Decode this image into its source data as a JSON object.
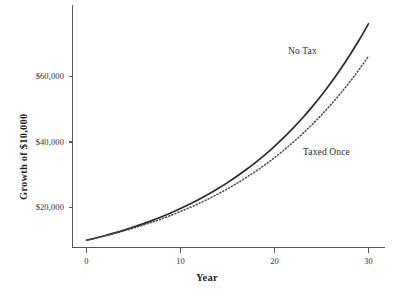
{
  "chart_data": {
    "type": "line",
    "title": "",
    "xlabel": "Year",
    "ylabel": "Growth of $10,000",
    "x": [
      0,
      1,
      2,
      3,
      4,
      5,
      6,
      7,
      8,
      9,
      10,
      11,
      12,
      13,
      14,
      15,
      16,
      17,
      18,
      19,
      20,
      21,
      22,
      23,
      24,
      25,
      26,
      27,
      28,
      29,
      30
    ],
    "xlim": [
      -1.5,
      33
    ],
    "ylim": [
      6500,
      80000
    ],
    "grid": false,
    "legend_position": "inline-annotation",
    "x_tick_values": [
      0,
      10,
      20,
      30
    ],
    "x_tick_labels": [
      "0",
      "10",
      "20",
      "30"
    ],
    "y_tick_values": [
      20000,
      40000,
      60000
    ],
    "y_tick_labels": [
      "$20,000",
      "$40,000",
      "$60,000"
    ],
    "series": [
      {
        "name": "No Tax",
        "style": "solid",
        "annotation": "No Tax",
        "values": [
          10000,
          10700,
          11449,
          12250,
          13108,
          14026,
          15007,
          16058,
          17182,
          18385,
          19672,
          21049,
          22522,
          24098,
          25785,
          27590,
          29522,
          31588,
          33799,
          36165,
          38697,
          41406,
          44304,
          47405,
          50724,
          54274,
          58074,
          62139,
          66488,
          71143,
          76123
        ]
      },
      {
        "name": "Taxed Once",
        "style": "dotted",
        "annotation": "Taxed Once",
        "values": [
          10000,
          10650,
          11342,
          12079,
          12864,
          13700,
          14591,
          15539,
          16549,
          17625,
          18771,
          19991,
          21290,
          22674,
          24148,
          25718,
          27389,
          29170,
          31066,
          33085,
          35236,
          37526,
          39965,
          42563,
          45330,
          48277,
          51415,
          54757,
          58317,
          62108,
          66145
        ]
      }
    ]
  },
  "axes": {
    "y_title": "Growth of $10,000",
    "x_title": "Year"
  },
  "annotations": {
    "no_tax": "No Tax",
    "taxed_once": "Taxed Once"
  },
  "colors": {
    "background": "#ffffff",
    "axis": "#58585a",
    "solid_series": "#2b2b2b",
    "dotted_series": "#4a4a4a",
    "text": "#2f2f2f"
  }
}
